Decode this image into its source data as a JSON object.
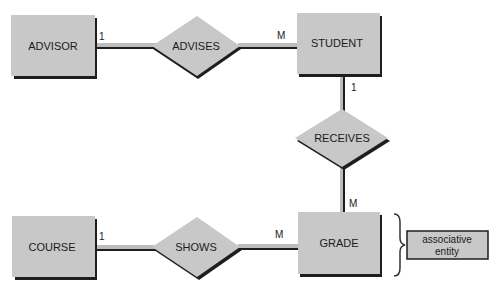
{
  "diagram": {
    "type": "entity-relationship",
    "colors": {
      "fill": "#c8c8c8",
      "shadow": "#1e1e1e",
      "line_fill": "#bdbdbd",
      "text": "#1a1a1a"
    },
    "entities": [
      {
        "id": "advisor",
        "label": "ADVISOR"
      },
      {
        "id": "student",
        "label": "STUDENT"
      },
      {
        "id": "course",
        "label": "COURSE"
      },
      {
        "id": "grade",
        "label": "GRADE"
      }
    ],
    "relationships": [
      {
        "id": "advises",
        "label": "ADVISES"
      },
      {
        "id": "receives",
        "label": "RECEIVES"
      },
      {
        "id": "shows",
        "label": "SHOWS"
      }
    ],
    "cardinalities": {
      "advisor_advises": "1",
      "advises_student": "M",
      "student_receives": "1",
      "receives_grade": "M",
      "course_shows": "1",
      "shows_grade": "M"
    },
    "annotation": {
      "line1": "associative",
      "line2": "entity"
    }
  }
}
